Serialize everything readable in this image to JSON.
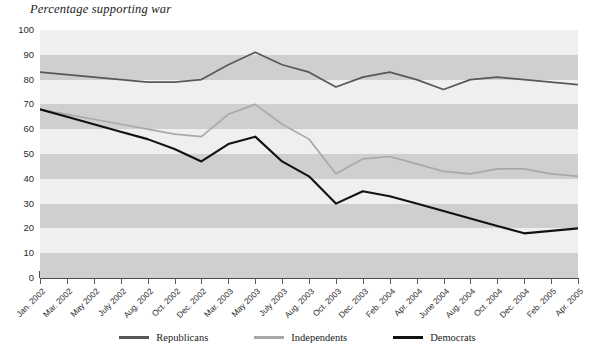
{
  "chart_data": {
    "type": "line",
    "title": "Percentage supporting war",
    "xlabel": "",
    "ylabel": "",
    "ylim": [
      0,
      100
    ],
    "ytick_step": 10,
    "yticks": [
      100,
      90,
      80,
      70,
      60,
      50,
      40,
      30,
      20,
      10,
      0
    ],
    "grid": "horizontal-alternating-bands",
    "legend_position": "bottom-center",
    "categories": [
      "Jan. 2002",
      "Mar. 2002",
      "May 2002",
      "July 2002",
      "Aug. 2002",
      "Oct. 2002",
      "Dec. 2002",
      "Mar. 2003",
      "May 2003",
      "July 2003",
      "Aug. 2003",
      "Oct. 2003",
      "Dec. 2003",
      "Feb. 2004",
      "Apr. 2004",
      "June 2004",
      "Aug. 2004",
      "Oct. 2004",
      "Dec. 2004",
      "Feb. 2005",
      "Apr. 2005"
    ],
    "series": [
      {
        "name": "Republicans",
        "color": "#585858",
        "values": [
          83,
          82,
          81,
          80,
          79,
          79,
          80,
          86,
          91,
          86,
          83,
          77,
          81,
          83,
          80,
          76,
          80,
          81,
          80,
          79,
          78
        ]
      },
      {
        "name": "Independents",
        "color": "#a9a9a9",
        "values": [
          68,
          66,
          64,
          62,
          60,
          58,
          57,
          66,
          70,
          62,
          56,
          42,
          48,
          49,
          46,
          43,
          42,
          44,
          44,
          42,
          41
        ]
      },
      {
        "name": "Democrats",
        "color": "#111111",
        "values": [
          68,
          65,
          62,
          59,
          56,
          52,
          47,
          54,
          57,
          47,
          41,
          30,
          35,
          33,
          30,
          27,
          24,
          21,
          18,
          19,
          20
        ]
      }
    ]
  },
  "legend": {
    "items": [
      {
        "label": "Republicans",
        "color": "#585858"
      },
      {
        "label": "Independents",
        "color": "#a9a9a9"
      },
      {
        "label": "Democrats",
        "color": "#111111"
      }
    ]
  },
  "bands": {
    "dark_color": "#cfcfcf",
    "light_color": "#efefef"
  }
}
